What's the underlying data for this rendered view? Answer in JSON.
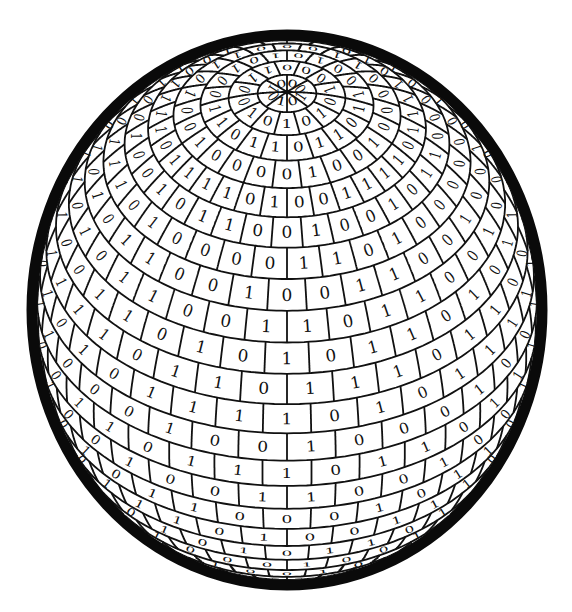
{
  "figure": {
    "background": "#ffffff",
    "ink": "#111111",
    "outline_color": "#0a0a0a"
  },
  "sphere": {
    "cx": 287,
    "cy": 310,
    "rx": 250,
    "ry": 270,
    "pole_y": 92,
    "outline_width": 11,
    "latitude_bands": 18,
    "meridians": 32
  },
  "digit_rows": [
    {
      "band": 1,
      "digits": "0101000110"
    },
    {
      "band": 2,
      "digits": "01101100101010"
    },
    {
      "band": 3,
      "digits": "1001000011000110"
    },
    {
      "band": 4,
      "digits": "0011110111101001101"
    },
    {
      "band": 5,
      "digits": "10010110000101001001100"
    },
    {
      "band": 6,
      "digits": "110100000010101100001101"
    },
    {
      "band": 7,
      "digits": "0110010010101001110010101"
    },
    {
      "band": 8,
      "digits": "1011001000011001000110110"
    },
    {
      "band": 9,
      "digits": "0110101100011001100101110"
    },
    {
      "band": 10,
      "digits": "1110110001000100010101011"
    },
    {
      "band": 11,
      "digits": "0101111101110000110011101"
    },
    {
      "band": 12,
      "digits": "1000100101001000001001011"
    },
    {
      "band": 13,
      "digits": "0110111111011101011100100"
    },
    {
      "band": 14,
      "digits": "1001001010010010101110100"
    },
    {
      "band": 15,
      "digits": "0101100101001000100101101"
    },
    {
      "band": 16,
      "digits": "0011101001001011000011100"
    },
    {
      "band": 17,
      "digits": "1101010100110100010101001"
    }
  ]
}
